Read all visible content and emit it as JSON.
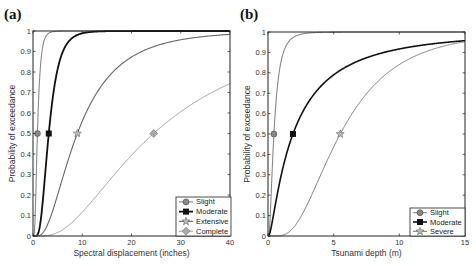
{
  "chart_data": [
    {
      "panel": "(a)",
      "type": "line",
      "title": "",
      "xlabel": "Spectral displacement (inches)",
      "ylabel": "Probability of exceedance",
      "xlim": [
        0,
        40
      ],
      "ylim": [
        0,
        1
      ],
      "xticks": [
        "0",
        "10",
        "20",
        "30",
        "40"
      ],
      "yticks": [
        "0",
        "0.1",
        "0.2",
        "0.3",
        "0.4",
        "0.5",
        "0.6",
        "0.7",
        "0.8",
        "0.9",
        "1"
      ],
      "grid": false,
      "legend_position": "lower right",
      "series": [
        {
          "name": "Slight",
          "marker": "circle",
          "color": "#888888",
          "width": 1.1,
          "median": 0.9,
          "beta": 0.55,
          "marker_point": [
            0.9,
            0.5
          ]
        },
        {
          "name": "Moderate",
          "marker": "square",
          "color": "#111111",
          "width": 1.8,
          "median": 3.2,
          "beta": 0.5,
          "marker_point": [
            3.2,
            0.5
          ]
        },
        {
          "name": "Extensive",
          "marker": "star",
          "color": "#666666",
          "width": 1.1,
          "median": 9.0,
          "beta": 0.7,
          "marker_point": [
            9.0,
            0.5
          ]
        },
        {
          "name": "Complete",
          "marker": "diamond",
          "color": "#999999",
          "width": 1.0,
          "median": 24.5,
          "beta": 0.75,
          "marker_point": [
            24.5,
            0.5
          ]
        }
      ]
    },
    {
      "panel": "(b)",
      "type": "line",
      "title": "",
      "xlabel": "Tsunami depth (m)",
      "ylabel": "Probability of exceedance",
      "xlim": [
        0,
        15
      ],
      "ylim": [
        0,
        1
      ],
      "xticks": [
        "0",
        "5",
        "10",
        "15"
      ],
      "yticks": [
        "0",
        "0.1",
        "0.2",
        "0.3",
        "0.4",
        "0.5",
        "0.6",
        "0.7",
        "0.8",
        "0.9",
        "1"
      ],
      "grid": false,
      "legend_position": "lower right",
      "series": [
        {
          "name": "Slight",
          "marker": "circle",
          "color": "#888888",
          "width": 1.1,
          "median": 0.45,
          "beta": 0.75,
          "marker_point": [
            0.45,
            0.5
          ]
        },
        {
          "name": "Moderate",
          "marker": "square",
          "color": "#111111",
          "width": 1.6,
          "median": 1.9,
          "beta": 1.2,
          "marker_point": [
            1.9,
            0.5
          ]
        },
        {
          "name": "Severe",
          "marker": "star",
          "color": "#777777",
          "width": 1.0,
          "median": 5.5,
          "beta": 0.6,
          "marker_point": [
            5.5,
            0.5
          ]
        }
      ]
    }
  ]
}
